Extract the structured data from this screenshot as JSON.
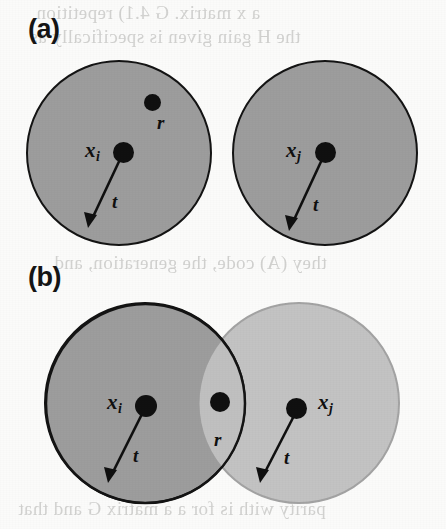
{
  "figure": {
    "type": "scanned-book-figure",
    "width": 446,
    "height": 529,
    "background_color": "#fbfbfa"
  },
  "panels": [
    {
      "id": "a",
      "label": "(a)",
      "description": "two separate non-overlapping discs of radius t",
      "discs": [
        {
          "id": "a-left",
          "shade": "dark",
          "fill_color": "#9d9d9d",
          "stroke_color": "#141414",
          "center_label": "x",
          "center_subscript": "i",
          "radius_label": "t",
          "extra_point_label": "r"
        },
        {
          "id": "a-right",
          "shade": "dark",
          "fill_color": "#9d9d9d",
          "stroke_color": "#141414",
          "center_label": "x",
          "center_subscript": "j",
          "radius_label": "t"
        }
      ]
    },
    {
      "id": "b",
      "label": "(b)",
      "description": "two overlapping discs of radius t sharing point r",
      "discs": [
        {
          "id": "b-left",
          "shade": "dark",
          "fill_color": "#9d9d9d",
          "stroke_color": "#141414",
          "center_label": "x",
          "center_subscript": "i",
          "radius_label": "t"
        },
        {
          "id": "b-right",
          "shade": "light",
          "fill_color": "#c3c3c3",
          "stroke_color": "#a3a3a3",
          "center_label": "x",
          "center_subscript": "j",
          "radius_label": "t"
        }
      ],
      "overlap_point_label": "r"
    }
  ],
  "labels": {
    "x_symbol": "x",
    "sub_i": "i",
    "sub_j": "j",
    "r_symbol": "r",
    "t_symbol": "t"
  },
  "bleed_through_text": {
    "top_line_1": "a x matrix. G  4.1) repetition",
    "top_line_2": "the H gain given is specifically as",
    "middle_line": "they (A) code, the generation, and",
    "bottom_line": "parity with is for a a matrix G and that"
  }
}
